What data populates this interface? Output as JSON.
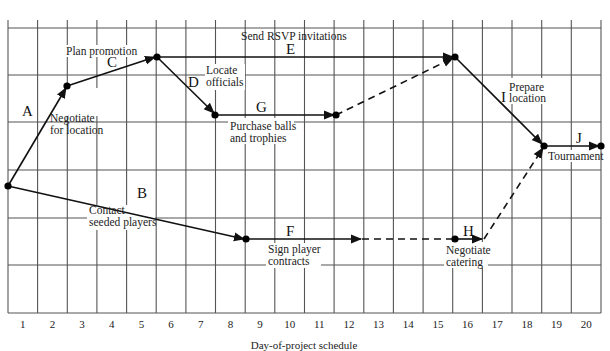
{
  "diagram": {
    "type": "time-scaled network (CPM/PERT) schedule",
    "x_axis": {
      "label": "Day-of-project schedule",
      "ticks": [
        "1",
        "2",
        "3",
        "4",
        "5",
        "6",
        "7",
        "8",
        "9",
        "10",
        "11",
        "12",
        "13",
        "14",
        "15",
        "16",
        "17",
        "18",
        "19",
        "20"
      ]
    },
    "activities": [
      {
        "id": "A",
        "letter": "A",
        "desc_lines": [
          "Negotiate",
          "for location"
        ],
        "style": "solid"
      },
      {
        "id": "B",
        "letter": "B",
        "desc_lines": [
          "Contact",
          "seeded players"
        ],
        "style": "solid"
      },
      {
        "id": "C",
        "letter": "C",
        "desc_lines": [
          "Plan promotion"
        ],
        "style": "solid"
      },
      {
        "id": "D",
        "letter": "D",
        "desc_lines": [
          "Locate",
          "officials"
        ],
        "style": "solid"
      },
      {
        "id": "E",
        "letter": "E",
        "desc_lines": [
          "Send RSVP invitations"
        ],
        "style": "solid"
      },
      {
        "id": "F",
        "letter": "F",
        "desc_lines": [
          "Sign player",
          "contracts"
        ],
        "style": "solid"
      },
      {
        "id": "G",
        "letter": "G",
        "desc_lines": [
          "Purchase balls",
          "and trophies"
        ],
        "style": "solid"
      },
      {
        "id": "H",
        "letter": "H",
        "desc_lines": [
          "Negotiate",
          "catering"
        ],
        "style": "solid"
      },
      {
        "id": "I",
        "letter": "I",
        "desc_lines": [
          "Prepare",
          "location"
        ],
        "style": "solid"
      },
      {
        "id": "J",
        "letter": "J",
        "desc_lines": [
          "Tournament"
        ],
        "style": "solid"
      }
    ],
    "slack_links": [
      {
        "from": "end of G",
        "to": "start of I",
        "style": "dashed"
      },
      {
        "from": "end of F",
        "to": "start of H",
        "style": "dashed"
      },
      {
        "from": "end of H",
        "to": "start of J",
        "style": "dashed"
      }
    ]
  }
}
